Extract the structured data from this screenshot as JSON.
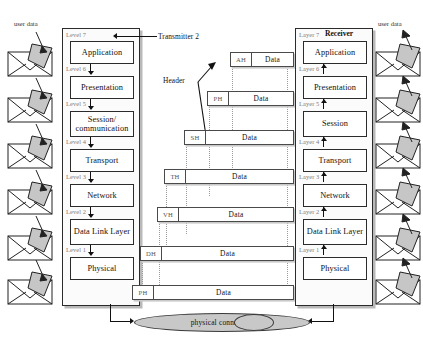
{
  "diagram": {
    "transmitter": {
      "title": "Transmitter 2",
      "user_data_label": "user data",
      "levels": [
        {
          "level_label": "Level 7",
          "name": "Application"
        },
        {
          "level_label": "Level 6",
          "name": "Presentation"
        },
        {
          "level_label": "Level 5",
          "name": "Session/ communication"
        },
        {
          "level_label": "Level 4",
          "name": "Transport"
        },
        {
          "level_label": "Level 3",
          "name": "Network"
        },
        {
          "level_label": "Level 2",
          "name": "Data Link Layer"
        },
        {
          "level_label": "Level 1",
          "name": "Physical"
        }
      ]
    },
    "receiver": {
      "title": "Receiver",
      "user_data_label": "user data",
      "levels": [
        {
          "level_label": "Layer 7",
          "name": "Application"
        },
        {
          "level_label": "Layer 6",
          "name": "Presentation"
        },
        {
          "level_label": "Layer 5",
          "name": "Session"
        },
        {
          "level_label": "Layer 4",
          "name": "Transport"
        },
        {
          "level_label": "Layer 3",
          "name": "Network"
        },
        {
          "level_label": "Layer 2",
          "name": "Data Link Layer"
        },
        {
          "level_label": "Layer 1",
          "name": "Physical"
        }
      ]
    },
    "header_callout": "Header",
    "pdus": [
      {
        "header": "AH",
        "data": "Data"
      },
      {
        "header": "PH",
        "data": "Data"
      },
      {
        "header": "SH",
        "data": "Data"
      },
      {
        "header": "TH",
        "data": "Data"
      },
      {
        "header": "VH",
        "data": "Data"
      },
      {
        "header": "DH",
        "data": "Data"
      },
      {
        "header": "PH",
        "data": "Data"
      }
    ],
    "physical_connection": "physical connection",
    "colors": {
      "line": "#111111",
      "box_border": "#2b2b2b",
      "muted_label": "#7b7b7b",
      "ellipse_fill": "#c8c8c8",
      "envelope_flap": "#c0c0c0"
    }
  }
}
